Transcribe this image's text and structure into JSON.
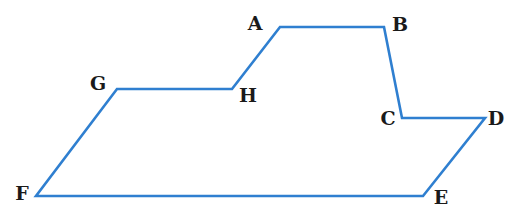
{
  "diagram": {
    "type": "polygon",
    "stroke_color": "#2f7fd0",
    "stroke_width": 2.6,
    "label_color": "#1a1a1a",
    "vertices": [
      {
        "label": "A",
        "x": 280,
        "y": 27,
        "lx": 255,
        "ly": 30
      },
      {
        "label": "B",
        "x": 384,
        "y": 27,
        "lx": 400,
        "ly": 31
      },
      {
        "label": "C",
        "x": 402,
        "y": 118,
        "lx": 388,
        "ly": 125
      },
      {
        "label": "D",
        "x": 485,
        "y": 118,
        "lx": 496,
        "ly": 125
      },
      {
        "label": "E",
        "x": 423,
        "y": 196,
        "lx": 441,
        "ly": 204
      },
      {
        "label": "F",
        "x": 36,
        "y": 196,
        "lx": 22,
        "ly": 200
      },
      {
        "label": "G",
        "x": 117,
        "y": 89,
        "lx": 98,
        "ly": 90
      },
      {
        "label": "H",
        "x": 232,
        "y": 89,
        "lx": 248,
        "ly": 102
      }
    ]
  }
}
